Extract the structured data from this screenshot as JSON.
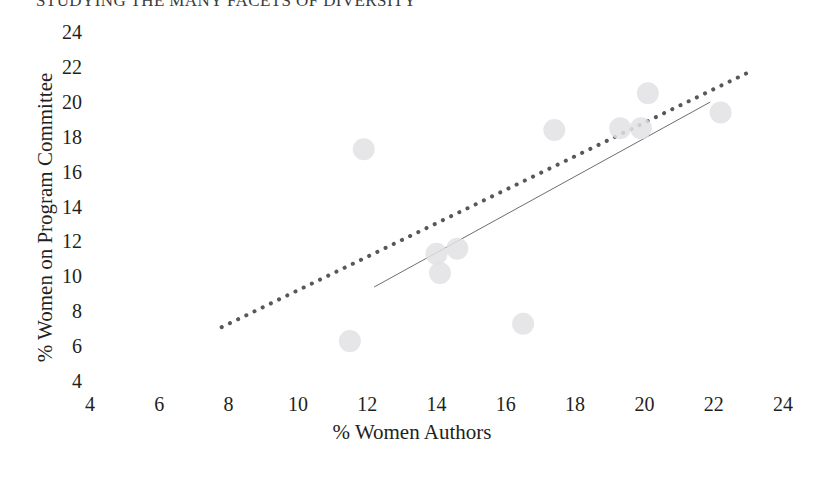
{
  "page": {
    "running_title": "STUDYING THE MANY FACETS OF DIVERSITY"
  },
  "chart_data": {
    "type": "scatter",
    "title": "",
    "xlabel": "% Women Authors",
    "ylabel": "% Women on Program Committee",
    "xlim": [
      4,
      24
    ],
    "ylim": [
      4,
      24
    ],
    "xticks": [
      4,
      6,
      8,
      10,
      12,
      14,
      16,
      18,
      20,
      22,
      24
    ],
    "yticks": [
      4,
      6,
      8,
      10,
      12,
      14,
      16,
      18,
      20,
      22,
      24
    ],
    "grid": false,
    "legend": "none",
    "marker": {
      "shape": "circle",
      "color": "#e2e2e4",
      "radius_px": 11,
      "opacity": 0.85
    },
    "points": [
      {
        "x": 11.5,
        "y": 6.4
      },
      {
        "x": 11.9,
        "y": 17.4
      },
      {
        "x": 14.0,
        "y": 11.4
      },
      {
        "x": 14.1,
        "y": 10.3
      },
      {
        "x": 14.6,
        "y": 11.7
      },
      {
        "x": 16.5,
        "y": 7.4
      },
      {
        "x": 17.4,
        "y": 18.5
      },
      {
        "x": 19.3,
        "y": 18.6
      },
      {
        "x": 19.9,
        "y": 18.6
      },
      {
        "x": 20.1,
        "y": 20.6
      },
      {
        "x": 22.2,
        "y": 19.5
      }
    ],
    "lines": [
      {
        "name": "dotted-trendline",
        "style": "dotted",
        "color": "#58585b",
        "width_px": 4,
        "x0": 7.8,
        "y0": 7.2,
        "x1": 23.0,
        "y1": 21.8
      },
      {
        "name": "solid-trendline",
        "style": "solid",
        "color": "#6d6d70",
        "width_px": 1,
        "x0": 12.2,
        "y0": 9.5,
        "x1": 21.9,
        "y1": 20.1
      }
    ]
  }
}
